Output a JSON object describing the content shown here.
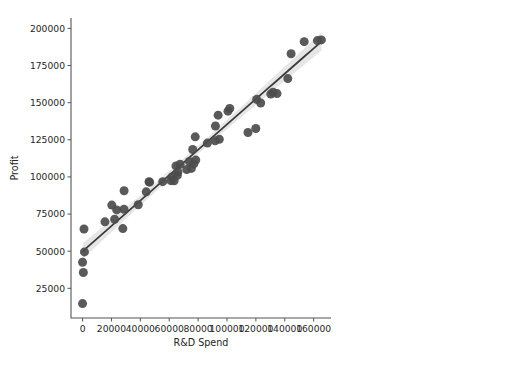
{
  "figure": {
    "background_color": "#ffffff",
    "outer_background_color": "#f2f2f2",
    "panel_left": 4,
    "panel_top": 4,
    "panel_width": 517,
    "panel_height": 348
  },
  "axes": {
    "plot_left": 71,
    "plot_right": 331,
    "plot_top": 18,
    "plot_bottom": 318,
    "spine_color": "#555555"
  },
  "style": {
    "point_color": "#4c4c4c",
    "line_color": "#3a3a3a",
    "ci_band_color": "#b8b8b8",
    "text_color": "#262626"
  },
  "chart_data": {
    "type": "scatter",
    "title": "",
    "xlabel": "R&D Spend",
    "ylabel": "Profit",
    "xlim": [
      -8000,
      172000
    ],
    "ylim": [
      5000,
      207000
    ],
    "grid": false,
    "legend": null,
    "xticks": [
      0,
      20000,
      40000,
      60000,
      80000,
      100000,
      120000,
      140000,
      160000
    ],
    "xticklabels": [
      "0",
      "20000",
      "40000",
      "60000",
      "80000",
      "100000",
      "120000",
      "140000",
      "160000"
    ],
    "yticks": [
      25000,
      50000,
      75000,
      100000,
      125000,
      150000,
      175000,
      200000
    ],
    "yticklabels": [
      "25000",
      "50000",
      "75000",
      "100000",
      "125000",
      "150000",
      "175000",
      "200000"
    ],
    "regression": {
      "show_line": true,
      "show_ci": true,
      "ci_level": 95,
      "intercept": 49900,
      "slope": 0.8543
    },
    "series": [
      {
        "name": "Startups",
        "marker": "circle",
        "marker_size": 5.4,
        "points": [
          [
            165349,
            192262
          ],
          [
            162598,
            191792
          ],
          [
            153442,
            191050
          ],
          [
            144372,
            182902
          ],
          [
            142107,
            166188
          ],
          [
            131877,
            156991
          ],
          [
            134615,
            156122
          ],
          [
            130298,
            155753
          ],
          [
            120543,
            152212
          ],
          [
            123335,
            149760
          ],
          [
            101913,
            146122
          ],
          [
            100672,
            144259
          ],
          [
            93864,
            141586
          ],
          [
            91992,
            134307
          ],
          [
            119943,
            132603
          ],
          [
            114524,
            129917
          ],
          [
            78013,
            126993
          ],
          [
            94657,
            125370
          ],
          [
            91749,
            124267
          ],
          [
            86419,
            122777
          ],
          [
            76254,
            118474
          ],
          [
            78389,
            111313
          ],
          [
            73994,
            110352
          ],
          [
            77044,
            108734
          ],
          [
            67532,
            108552
          ],
          [
            64665,
            107404
          ],
          [
            75329,
            105734
          ],
          [
            72108,
            105008
          ],
          [
            66051,
            103282
          ],
          [
            65605,
            101004
          ],
          [
            61994,
            99938
          ],
          [
            61136,
            97484
          ],
          [
            63409,
            97427
          ],
          [
            55494,
            96779
          ],
          [
            46014,
            96713
          ],
          [
            46426,
            96479
          ],
          [
            28754,
            90708
          ],
          [
            44070,
            89949
          ],
          [
            20230,
            81005
          ],
          [
            38558,
            81229
          ],
          [
            28663,
            78239
          ],
          [
            23641,
            77799
          ],
          [
            15505,
            69758
          ],
          [
            22178,
            71498
          ],
          [
            1000,
            64926
          ],
          [
            27893,
            65200
          ],
          [
            1315,
            49490
          ],
          [
            0,
            42560
          ],
          [
            542,
            35673
          ],
          [
            0,
            14681
          ]
        ]
      }
    ]
  }
}
